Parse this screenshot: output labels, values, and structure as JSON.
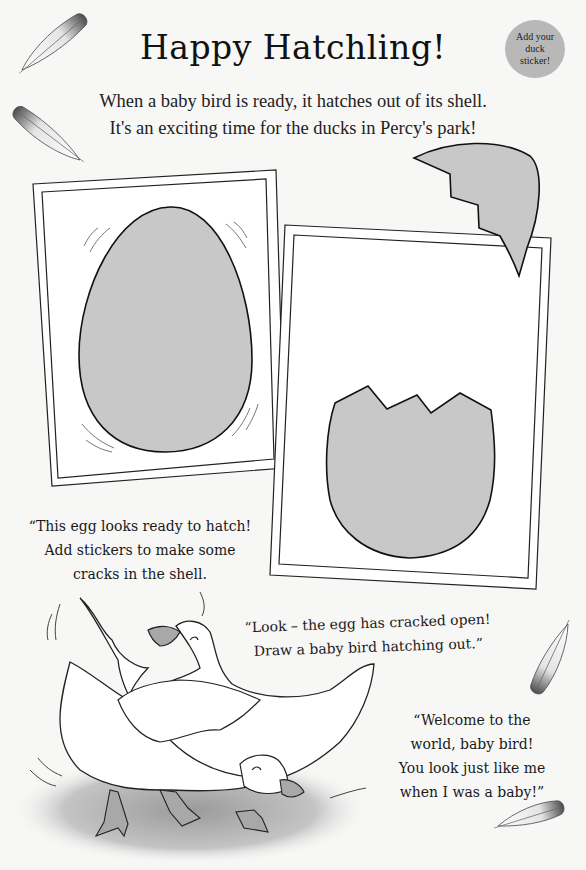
{
  "page": {
    "title": "Happy Hatchling!",
    "intro_line_1": "When a baby bird is ready, it hatches out of its shell.",
    "intro_line_2": "It's an exciting time for the ducks in Percy's park!",
    "badge": {
      "label": "Add your duck sticker!",
      "color": "#b8b8b8"
    }
  },
  "panels": [
    {
      "name": "whole-egg",
      "description": "Whole grey egg with wobble lines",
      "egg_color": "#c8c8c8"
    },
    {
      "name": "cracked-egg",
      "description": "Bottom half of cracked egg with shell piece above",
      "egg_color": "#c8c8c8"
    }
  ],
  "captions": {
    "first": {
      "line_1": "“This egg looks ready to hatch!",
      "line_2": "Add stickers to make some",
      "line_3": "cracks in the shell."
    },
    "second": {
      "line_1": "“Look – the egg has cracked open!",
      "line_2": "Draw a baby bird hatching out.”"
    },
    "third": {
      "line_1": "“Welcome to the",
      "line_2": "world, baby bird!",
      "line_3": "You look just like me",
      "line_4": "when I was a baby!”"
    }
  },
  "decorations": {
    "feathers": [
      "feather-top-left",
      "feather-left",
      "feather-right",
      "feather-bottom-right"
    ],
    "illustration": "two-white-ducks"
  }
}
